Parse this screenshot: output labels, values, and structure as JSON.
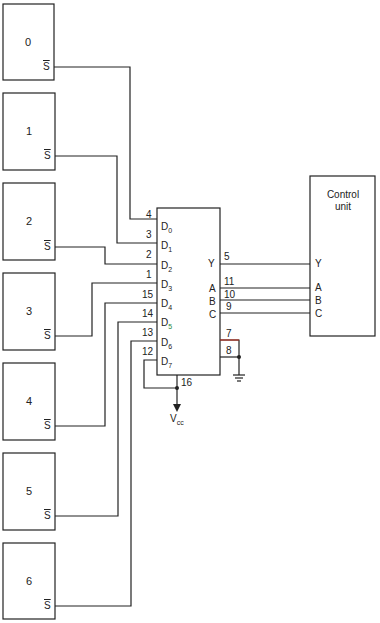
{
  "diagram": {
    "stations": [
      {
        "label": "0",
        "output": "S"
      },
      {
        "label": "1",
        "output": "S"
      },
      {
        "label": "2",
        "output": "S"
      },
      {
        "label": "3",
        "output": "S"
      },
      {
        "label": "4",
        "output": "S"
      },
      {
        "label": "5",
        "output": "S"
      },
      {
        "label": "6",
        "output": "S"
      }
    ],
    "mux": {
      "data_inputs": [
        {
          "name": "D",
          "sub": "0",
          "pin": "4"
        },
        {
          "name": "D",
          "sub": "1",
          "pin": "3"
        },
        {
          "name": "D",
          "sub": "2",
          "pin": "2"
        },
        {
          "name": "D",
          "sub": "3",
          "pin": "1"
        },
        {
          "name": "D",
          "sub": "4",
          "pin": "15"
        },
        {
          "name": "D",
          "sub": "5",
          "pin": "14"
        },
        {
          "name": "D",
          "sub": "6",
          "pin": "13"
        },
        {
          "name": "D",
          "sub": "7",
          "pin": "12"
        }
      ],
      "outputs": [
        {
          "name": "Y",
          "pin": "5"
        },
        {
          "name": "A",
          "pin": "11"
        },
        {
          "name": "B",
          "pin": "10"
        },
        {
          "name": "C",
          "pin": "9"
        }
      ],
      "enable_pin": "7",
      "ground_pin": "8",
      "vcc_pin": "16",
      "vcc_label": "V",
      "vcc_sub": "cc"
    },
    "control_unit": {
      "title_line1": "Control",
      "title_line2": "unit",
      "ports": [
        "Y",
        "A",
        "B",
        "C"
      ]
    },
    "colors": {
      "line": "#222222",
      "accent_red": "#b03020",
      "accent_green": "#2a8a3a"
    }
  }
}
